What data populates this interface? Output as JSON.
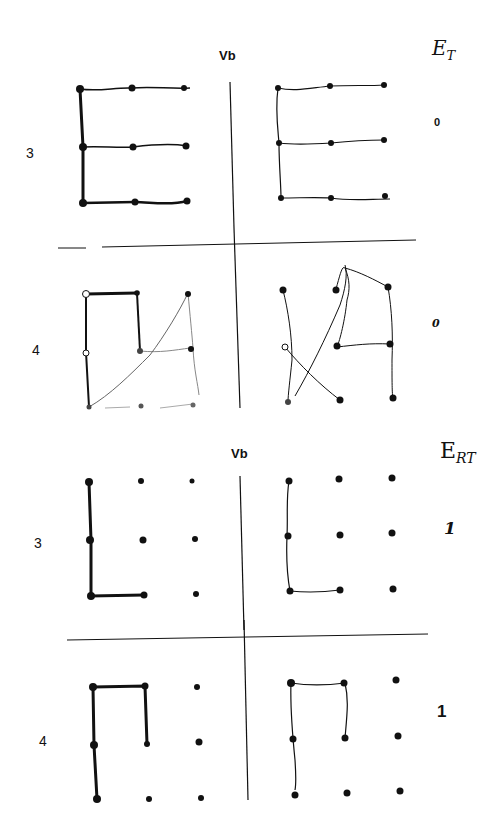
{
  "panels": [
    {
      "column_label": "Vb",
      "score_header": "E",
      "score_header_sub": "T",
      "rows": [
        {
          "label": "3",
          "score": "0",
          "model_figure": "E",
          "copy_figure": "E"
        },
        {
          "label": "4",
          "score": "0",
          "model_figure": "hook shape",
          "copy_figure": "distorted lines"
        }
      ]
    },
    {
      "column_label": "Vb",
      "score_header": "E",
      "score_header_sub": "RT",
      "rows": [
        {
          "label": "3",
          "score": "1",
          "model_figure": "L",
          "copy_figure": "L"
        },
        {
          "label": "4",
          "score": "1",
          "model_figure": "hook shape",
          "copy_figure": "hook shape"
        }
      ]
    }
  ]
}
